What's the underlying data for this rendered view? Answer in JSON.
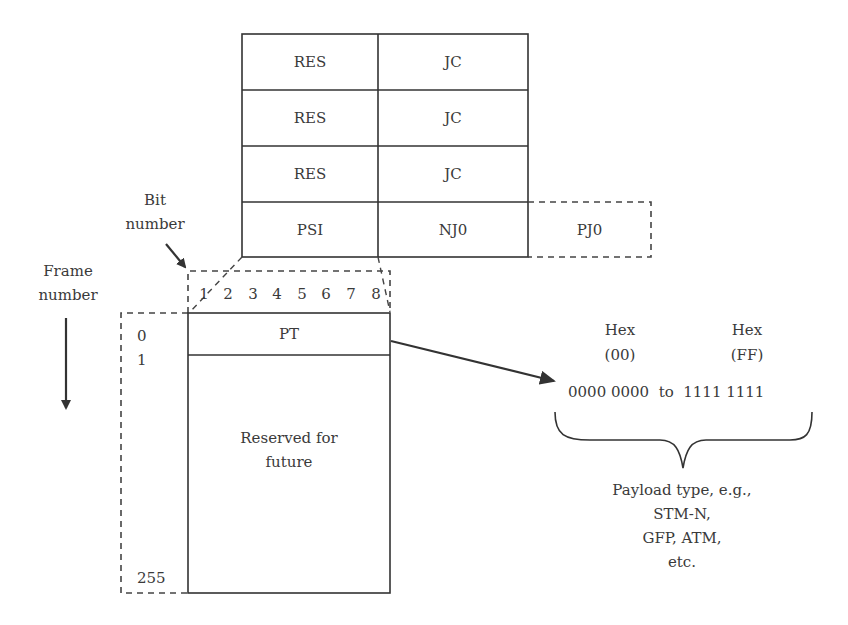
{
  "diagram": {
    "title": "",
    "top_table": {
      "rows": [
        {
          "col1": "RES",
          "col2": "JC"
        },
        {
          "col1": "RES",
          "col2": "JC"
        },
        {
          "col1": "RES",
          "col2": "JC"
        },
        {
          "col1": "PSI",
          "col2": "NJ0",
          "col3": "PJ0"
        }
      ]
    },
    "labels": {
      "bit_number": [
        "Bit",
        "number"
      ],
      "frame_number": [
        "Frame",
        "number"
      ]
    },
    "bit_numbers": [
      "1",
      "2",
      "3",
      "4",
      "5",
      "6",
      "7",
      "8"
    ],
    "frame_numbers": {
      "first": "0",
      "second": "1",
      "last": "255"
    },
    "psi_block": {
      "pt_label": "PT",
      "reserved_label": [
        "Reserved for",
        "future"
      ]
    },
    "hex_range": {
      "left_heading": "Hex",
      "left_value": "(00)",
      "right_heading": "Hex",
      "right_value": "(FF)",
      "range_text": "0000 0000  to  1111 1111"
    },
    "payload_note": [
      "Payload type, e.g.,",
      "STM-N,",
      "GFP, ATM,",
      "etc."
    ],
    "colors": {
      "line": "#333333",
      "dashed": "#444444",
      "text": "#3a3a3a",
      "background": "#ffffff"
    }
  }
}
